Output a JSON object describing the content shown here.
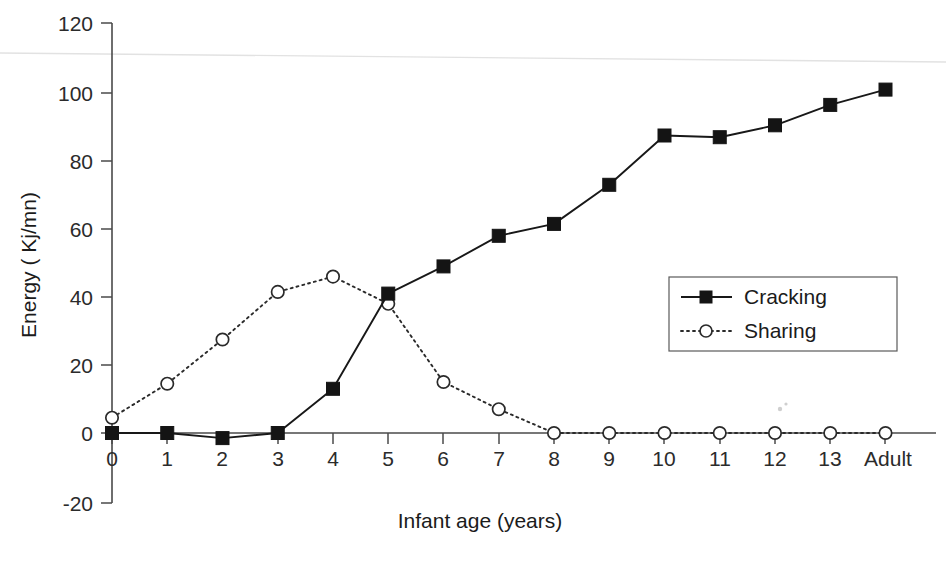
{
  "chart_data": {
    "type": "line",
    "title": "",
    "xlabel": "Infant age (years)",
    "ylabel": "Energy ( Kj/mn)",
    "categories": [
      "0",
      "1",
      "2",
      "3",
      "4",
      "5",
      "6",
      "7",
      "8",
      "9",
      "10",
      "11",
      "12",
      "13",
      "Adult"
    ],
    "x_tick_labels": [
      "0",
      "1",
      "2",
      "3",
      "4",
      "5",
      "6",
      "7",
      "8",
      "9",
      "10",
      "11",
      "12",
      "13",
      "Adult"
    ],
    "y_tick_labels": [
      "-20",
      "0",
      "20",
      "40",
      "60",
      "80",
      "100",
      "120"
    ],
    "y_ticks": [
      -20,
      0,
      20,
      40,
      60,
      80,
      100,
      120
    ],
    "ylim": [
      -20,
      120
    ],
    "grid": false,
    "legend_position": "center-right",
    "series": [
      {
        "name": "Cracking",
        "marker": "filled-square",
        "linestyle": "solid",
        "color": "#181818",
        "values": [
          0,
          0,
          -1.5,
          0,
          13,
          41,
          49,
          58,
          61.5,
          73,
          87.5,
          87,
          90.5,
          96.5,
          101
        ]
      },
      {
        "name": "Sharing",
        "marker": "open-circle",
        "linestyle": "dotted",
        "color": "#2a2a2a",
        "values": [
          4.5,
          14.5,
          27.5,
          41.5,
          46,
          38,
          15,
          7,
          0,
          0,
          0,
          0,
          0,
          0,
          0
        ]
      }
    ]
  },
  "legend": {
    "entries": [
      {
        "label": "Cracking"
      },
      {
        "label": "Sharing"
      }
    ]
  },
  "axes": {
    "x_title": "Infant age (years)",
    "y_title": "Energy ( Kj/mn)"
  }
}
